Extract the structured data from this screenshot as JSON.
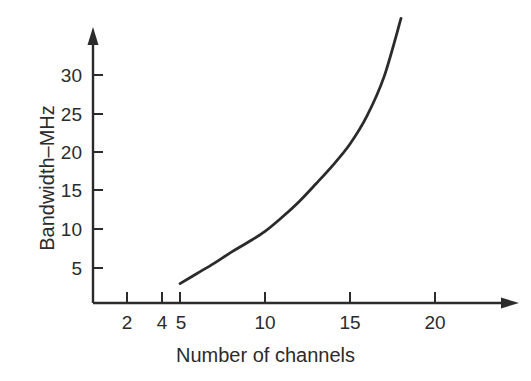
{
  "chart_data": {
    "type": "line",
    "title": "",
    "xlabel": "Number of channels",
    "ylabel": "Bandwidth–MHz",
    "xlim": [
      0,
      25
    ],
    "ylim": [
      0,
      39
    ],
    "grid": false,
    "legend": "none",
    "xticks": [
      2,
      4,
      5,
      10,
      15,
      20
    ],
    "xtick_labels": [
      "2",
      "4",
      "5",
      "10",
      "15",
      "20"
    ],
    "yticks": [
      5,
      10,
      15,
      20,
      25,
      30
    ],
    "ytick_labels": [
      "5",
      "10",
      "15",
      "20",
      "25",
      "30"
    ],
    "axis_arrows": {
      "x": "right",
      "y": "up"
    },
    "series": [
      {
        "name": "Bandwidth vs channels",
        "color": "#2b2b2b",
        "x": [
          5,
          6,
          7,
          8,
          9,
          10,
          11,
          12,
          13,
          14,
          15,
          16,
          17,
          18
        ],
        "y": [
          3.0,
          4.3,
          5.6,
          7.0,
          8.3,
          9.7,
          11.5,
          13.5,
          15.8,
          18.2,
          20.9,
          24.5,
          29.5,
          37.0
        ]
      }
    ]
  },
  "labels": {
    "ylabel": "Bandwidth–MHz",
    "xlabel": "Number of channels"
  }
}
